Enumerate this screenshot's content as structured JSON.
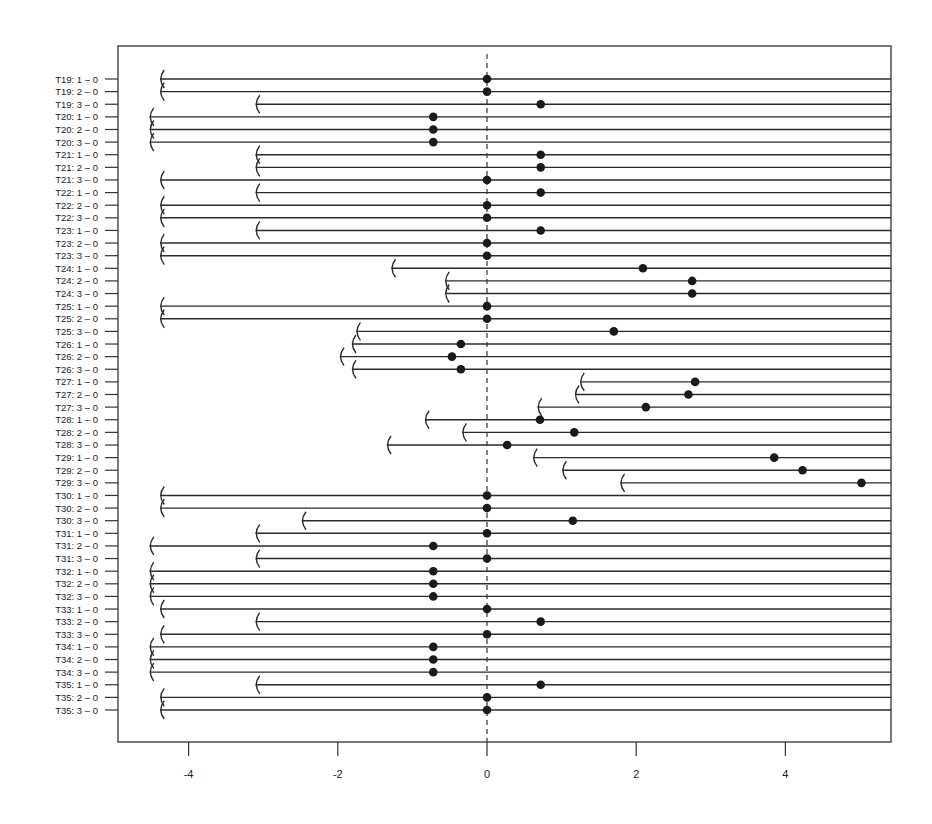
{
  "chart_data": {
    "type": "scatter",
    "subtype": "interval-censored forest plot",
    "title": "",
    "xlabel": "",
    "ylabel": "",
    "xlim": [
      -4.9,
      5.4
    ],
    "x_ticks": [
      -4,
      -2,
      0,
      2,
      4
    ],
    "x_tick_labels": [
      "-4",
      "-2",
      "0",
      "2",
      "4"
    ],
    "reference_line": {
      "x": 0,
      "style": "dashed"
    },
    "grid": false,
    "legend": null,
    "rows": [
      {
        "label": "T19: 1 – 0",
        "lower": -4.38,
        "point": 0.0
      },
      {
        "label": "T19: 2 – 0",
        "lower": -4.38,
        "point": 0.0
      },
      {
        "label": "T19: 3 – 0",
        "lower": -3.1,
        "point": 0.72
      },
      {
        "label": "T20: 1 – 0",
        "lower": -4.52,
        "point": -0.72
      },
      {
        "label": "T20: 2 – 0",
        "lower": -4.52,
        "point": -0.72
      },
      {
        "label": "T20: 3 – 0",
        "lower": -4.52,
        "point": -0.72
      },
      {
        "label": "T21: 1 – 0",
        "lower": -3.1,
        "point": 0.72
      },
      {
        "label": "T21: 2 – 0",
        "lower": -3.1,
        "point": 0.72
      },
      {
        "label": "T21: 3 – 0",
        "lower": -4.38,
        "point": 0.0
      },
      {
        "label": "T22: 1 – 0",
        "lower": -3.1,
        "point": 0.72
      },
      {
        "label": "T22: 2 – 0",
        "lower": -4.38,
        "point": 0.0
      },
      {
        "label": "T22: 3 – 0",
        "lower": -4.38,
        "point": 0.0
      },
      {
        "label": "T23: 1 – 0",
        "lower": -3.1,
        "point": 0.72
      },
      {
        "label": "T23: 2 – 0",
        "lower": -4.38,
        "point": 0.0
      },
      {
        "label": "T23: 3 – 0",
        "lower": -4.38,
        "point": 0.0
      },
      {
        "label": "T24: 1 – 0",
        "lower": -1.28,
        "point": 2.09
      },
      {
        "label": "T24: 2 – 0",
        "lower": -0.56,
        "point": 2.75
      },
      {
        "label": "T24: 3 – 0",
        "lower": -0.56,
        "point": 2.75
      },
      {
        "label": "T25: 1 – 0",
        "lower": -4.38,
        "point": 0.0
      },
      {
        "label": "T25: 2 – 0",
        "lower": -4.38,
        "point": 0.0
      },
      {
        "label": "T25: 3 – 0",
        "lower": -1.75,
        "point": 1.7
      },
      {
        "label": "T26: 1 – 0",
        "lower": -1.81,
        "point": -0.35
      },
      {
        "label": "T26: 2 – 0",
        "lower": -1.97,
        "point": -0.47
      },
      {
        "label": "T26: 3 – 0",
        "lower": -1.81,
        "point": -0.35
      },
      {
        "label": "T27: 1 – 0",
        "lower": 1.25,
        "point": 2.79
      },
      {
        "label": "T27: 2 – 0",
        "lower": 1.18,
        "point": 2.7
      },
      {
        "label": "T27: 3 – 0",
        "lower": 0.68,
        "point": 2.13
      },
      {
        "label": "T28: 1 – 0",
        "lower": -0.83,
        "point": 0.71
      },
      {
        "label": "T28: 2 – 0",
        "lower": -0.33,
        "point": 1.17
      },
      {
        "label": "T28: 3 – 0",
        "lower": -1.34,
        "point": 0.27
      },
      {
        "label": "T29: 1 – 0",
        "lower": 0.62,
        "point": 3.85
      },
      {
        "label": "T29: 2 – 0",
        "lower": 1.01,
        "point": 4.23
      },
      {
        "label": "T29: 3 – 0",
        "lower": 1.79,
        "point": 5.02
      },
      {
        "label": "T30: 1 – 0",
        "lower": -4.38,
        "point": 0.0
      },
      {
        "label": "T30: 2 – 0",
        "lower": -4.38,
        "point": 0.0
      },
      {
        "label": "T30: 3 – 0",
        "lower": -2.48,
        "point": 1.15
      },
      {
        "label": "T31: 1 – 0",
        "lower": -3.1,
        "point": 0.0
      },
      {
        "label": "T31: 2 – 0",
        "lower": -4.52,
        "point": -0.72
      },
      {
        "label": "T31: 3 – 0",
        "lower": -3.1,
        "point": 0.0
      },
      {
        "label": "T32: 1 – 0",
        "lower": -4.52,
        "point": -0.72
      },
      {
        "label": "T32: 2 – 0",
        "lower": -4.52,
        "point": -0.72
      },
      {
        "label": "T32: 3 – 0",
        "lower": -4.52,
        "point": -0.72
      },
      {
        "label": "T33: 1 – 0",
        "lower": -4.38,
        "point": 0.0
      },
      {
        "label": "T33: 2 – 0",
        "lower": -3.1,
        "point": 0.72
      },
      {
        "label": "T33: 3 – 0",
        "lower": -4.38,
        "point": 0.0
      },
      {
        "label": "T34: 1 – 0",
        "lower": -4.52,
        "point": -0.72
      },
      {
        "label": "T34: 2 – 0",
        "lower": -4.52,
        "point": -0.72
      },
      {
        "label": "T34: 3 – 0",
        "lower": -4.52,
        "point": -0.72
      },
      {
        "label": "T35: 1 – 0",
        "lower": -3.1,
        "point": 0.72
      },
      {
        "label": "T35: 2 – 0",
        "lower": -4.38,
        "point": 0.0
      },
      {
        "label": "T35: 3 – 0",
        "lower": -4.38,
        "point": 0.0
      }
    ],
    "upper_bound": "open (extends beyond plot right edge)"
  },
  "style": {
    "line_color": "#2a2a2a",
    "point_color": "#1a1a1a",
    "background": "#ffffff"
  }
}
